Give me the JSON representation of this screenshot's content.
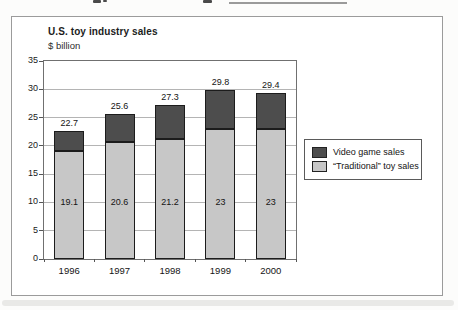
{
  "frame": {
    "background": "#ffffff",
    "border_color": "#9b9b9b"
  },
  "chart_data": {
    "type": "bar",
    "stacked": true,
    "title": "U.S. toy industry sales",
    "subtitle": "$ billion",
    "categories": [
      "1996",
      "1997",
      "1998",
      "1999",
      "2000"
    ],
    "series": [
      {
        "name": "“Traditional” toy sales",
        "color": "#c7c7c7",
        "values": [
          19.1,
          20.6,
          21.2,
          23,
          23
        ]
      },
      {
        "name": "Video game sales",
        "color": "#4d4d4d",
        "values": [
          3.6,
          5.0,
          6.1,
          6.8,
          6.4
        ]
      }
    ],
    "totals": [
      22.7,
      25.6,
      27.3,
      29.8,
      29.4
    ],
    "total_labels": [
      "22.7",
      "25.6",
      "27.3",
      "29.8",
      "29.4"
    ],
    "inner_labels": [
      "19.1",
      "20.6",
      "21.2",
      "23",
      "23"
    ],
    "xlabel": "",
    "ylabel": "",
    "ylim": [
      0,
      35
    ],
    "yticks": [
      0,
      5,
      10,
      15,
      20,
      25,
      30,
      35
    ],
    "ytick_labels": [
      "0",
      "5",
      "10",
      "15",
      "20",
      "25",
      "30",
      "35"
    ],
    "grid": true,
    "legend_position": "right-middle",
    "legend_items": [
      {
        "label": "Video game sales",
        "color": "#4d4d4d"
      },
      {
        "label": "“Traditional” toy sales",
        "color": "#c7c7c7"
      }
    ],
    "colors": {
      "grid": "#b4b4b4",
      "plot_border": "#707070",
      "bar_border": "#1c1c1c",
      "text": "#161616"
    }
  }
}
